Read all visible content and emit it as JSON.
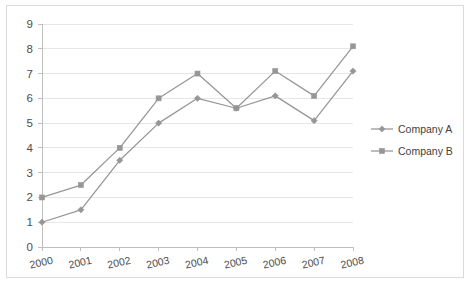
{
  "chart_data": {
    "type": "line",
    "title": "",
    "subtitle": "",
    "xlabel": "",
    "ylabel": "",
    "categories": [
      "2000",
      "2001",
      "2002",
      "2003",
      "2004",
      "2005",
      "2006",
      "2007",
      "2008"
    ],
    "x": [
      2000,
      2001,
      2002,
      2003,
      2004,
      2005,
      2006,
      2007,
      2008
    ],
    "series": [
      {
        "name": "Company A",
        "marker": "diamond",
        "color": "#969696",
        "values": [
          1.0,
          1.5,
          3.5,
          5.0,
          6.0,
          5.6,
          6.1,
          5.1,
          7.1
        ]
      },
      {
        "name": "Company B",
        "marker": "square",
        "color": "#969696",
        "values": [
          2.0,
          2.5,
          4.0,
          6.0,
          7.0,
          5.6,
          7.1,
          6.1,
          8.1
        ]
      }
    ],
    "ylim": [
      0,
      9
    ],
    "yticks": [
      "0",
      "1",
      "2",
      "3",
      "4",
      "5",
      "6",
      "7",
      "8",
      "9"
    ],
    "xlim": [
      2000,
      2008
    ],
    "grid": "horizontal",
    "legend_position": "right",
    "plot_background": "#ffffff",
    "gridline_color": "#e4e7ea",
    "axis_color": "#bfbfbf",
    "border_color": "#d9d9d9",
    "tick_label_color": "#4d4d4d",
    "x_tick_rotation": -12
  },
  "legend": {
    "entries": [
      {
        "label": "Company A",
        "marker": "diamond-marker",
        "color": "#969696"
      },
      {
        "label": "Company B",
        "marker": "square-marker",
        "color": "#969696"
      }
    ]
  }
}
